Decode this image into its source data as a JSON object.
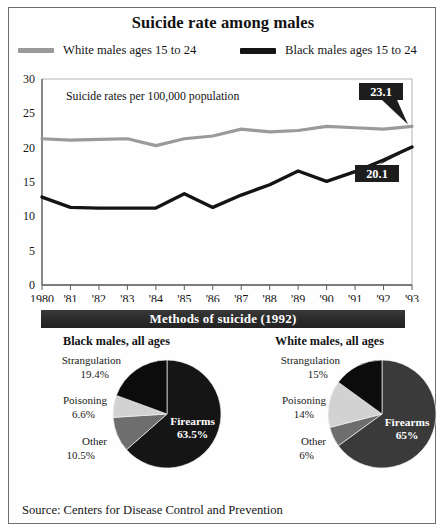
{
  "title": "Suicide rate among males",
  "legend": {
    "items": [
      {
        "label": "White males ages 15 to 24",
        "color": "#9a9a9a",
        "key": "white"
      },
      {
        "label": "Black males ages 15 to 24",
        "color": "#141414",
        "key": "black"
      }
    ]
  },
  "plot_note": "Suicide rates per 100,000 population",
  "callouts": [
    {
      "value": "23.1",
      "series": "white"
    },
    {
      "value": "20.1",
      "series": "black"
    }
  ],
  "methods_banner": "Methods of suicide (1992)",
  "pies": [
    {
      "heading": "Black males, all ages",
      "slices": [
        {
          "label": "Firearms",
          "pct": "63.5%",
          "value": 63.5,
          "color": "#151515",
          "inside": true
        },
        {
          "label": "Other",
          "pct": "10.5%",
          "value": 10.5,
          "color": "#6e6e6e",
          "inside": false
        },
        {
          "label": "Poisoning",
          "pct": "6.6%",
          "value": 6.6,
          "color": "#d2d2d2",
          "inside": false
        },
        {
          "label": "Strangulation",
          "pct": "19.4%",
          "value": 19.4,
          "color": "#0c0c0c",
          "inside": false
        }
      ]
    },
    {
      "heading": "White males, all ages",
      "slices": [
        {
          "label": "Firearms",
          "pct": "65%",
          "value": 65,
          "color": "#3a3a3a",
          "inside": true
        },
        {
          "label": "Other",
          "pct": "6%",
          "value": 6,
          "color": "#6e6e6e",
          "inside": false
        },
        {
          "label": "Poisoning",
          "pct": "14%",
          "value": 14,
          "color": "#d2d2d2",
          "inside": false
        },
        {
          "label": "Strangulation",
          "pct": "15%",
          "value": 15,
          "color": "#0c0c0c",
          "inside": false
        }
      ]
    }
  ],
  "source": "Source: Centers for Disease Control and Prevention",
  "chart_data": {
    "type": "line",
    "title": "Suicide rate among males",
    "subtitle": "Suicide rates per 100,000 population",
    "xlabel": "",
    "ylabel": "Suicide rates per 100,000 population",
    "ylim": [
      0,
      30
    ],
    "yticks": [
      0,
      5,
      10,
      15,
      20,
      25,
      30
    ],
    "grid": false,
    "legend_position": "top",
    "categories": [
      "1980",
      "'81",
      "'82",
      "'83",
      "'84",
      "'85",
      "'86",
      "'87",
      "'88",
      "'89",
      "'90",
      "'91",
      "'92",
      "'93"
    ],
    "series": [
      {
        "name": "White males ages 15 to 24",
        "color": "#9a9a9a",
        "values": [
          21.3,
          21.1,
          21.2,
          21.3,
          20.3,
          21.3,
          21.7,
          22.7,
          22.3,
          22.5,
          23.1,
          22.9,
          22.7,
          23.1
        ]
      },
      {
        "name": "Black males ages 15 to 24",
        "color": "#141414",
        "values": [
          12.8,
          11.3,
          11.2,
          11.2,
          11.2,
          13.3,
          11.3,
          13.1,
          14.6,
          16.6,
          15.1,
          16.5,
          18.2,
          20.1
        ]
      }
    ],
    "annotations": [
      {
        "text": "23.1",
        "series": "White males ages 15 to 24",
        "x": "'93",
        "y": 23.1
      },
      {
        "text": "20.1",
        "series": "Black males ages 15 to 24",
        "x": "'93",
        "y": 20.1
      }
    ],
    "pies": [
      {
        "type": "pie",
        "title": "Black males, all ages",
        "labels": [
          "Firearms",
          "Other",
          "Poisoning",
          "Strangulation"
        ],
        "values": [
          63.5,
          10.5,
          6.6,
          19.4
        ]
      },
      {
        "type": "pie",
        "title": "White males, all ages",
        "labels": [
          "Firearms",
          "Other",
          "Poisoning",
          "Strangulation"
        ],
        "values": [
          65,
          6,
          14,
          15
        ]
      }
    ]
  }
}
